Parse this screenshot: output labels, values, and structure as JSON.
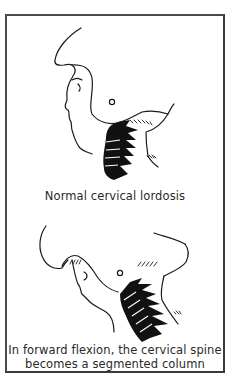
{
  "figure": {
    "panels": [
      {
        "id": "normal",
        "illustration": "head-profile-upright-cervical-spine",
        "caption": "Normal cervical lordosis"
      },
      {
        "id": "flexion",
        "illustration": "head-profile-forward-flexion-cervical-spine",
        "caption_line1": "In forward flexion, the cervical spine",
        "caption_line2": "becomes a segmented column"
      }
    ],
    "colors": {
      "line": "#1a1a1a",
      "spine_fill": "#111111",
      "border": "#4a4a4a",
      "background": "#ffffff"
    }
  }
}
